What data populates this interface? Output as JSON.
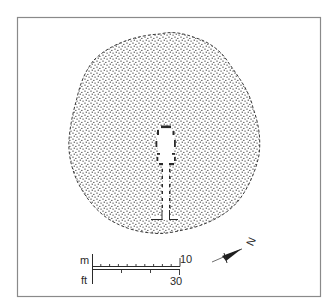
{
  "figure": {
    "type": "archaeological-site-plan",
    "frame_color": "#8a8a8a",
    "ink_color": "#2a2a2a",
    "stipple_color": "#3a3a3a"
  },
  "scale_bar": {
    "metric_unit": "m",
    "metric_max": "10",
    "metric_divisions": 10,
    "imperial_unit": "ft",
    "imperial_max": "30",
    "imperial_divisions": 3
  },
  "north_arrow": {
    "letter": "N",
    "direction_deg": -65
  }
}
